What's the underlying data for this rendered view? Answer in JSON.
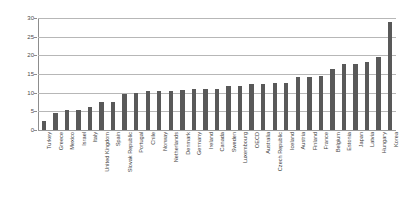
{
  "chart_data": {
    "type": "bar",
    "title": "",
    "subtitle": "",
    "xlabel": "",
    "ylabel": "",
    "ylim": [
      0,
      30
    ],
    "yticks": [
      0,
      5,
      10,
      15,
      20,
      25,
      30
    ],
    "grid": true,
    "legend": null,
    "bar_color": "#595959",
    "gridline_color": "#b7b7b7",
    "axis_color": "#8d8d8d",
    "categories": [
      "Turkey",
      "Greece",
      "Mexico",
      "Israel",
      "Italy",
      "United Kingdom",
      "Spain",
      "Slovak Republic",
      "Portugal",
      "Chile",
      "Norway",
      "Netherlands",
      "Denmark",
      "Germany",
      "Ireland",
      "Canada",
      "Sweden",
      "Luxembourg",
      "OECD",
      "Australia",
      "Czech Republic",
      "Iceland",
      "Austria",
      "Finland",
      "France",
      "Belgium",
      "Estonia",
      "Japan",
      "Latvia",
      "Hungary",
      "Korea"
    ],
    "values": [
      2.5,
      4.6,
      5.4,
      5.4,
      6.2,
      7.5,
      7.6,
      9.7,
      10.0,
      10.4,
      10.4,
      10.4,
      10.6,
      10.9,
      11.0,
      11.1,
      11.8,
      11.9,
      12.3,
      12.4,
      12.5,
      12.5,
      14.1,
      14.3,
      14.6,
      16.3,
      17.6,
      17.7,
      18.3,
      19.6,
      28.9
    ]
  }
}
